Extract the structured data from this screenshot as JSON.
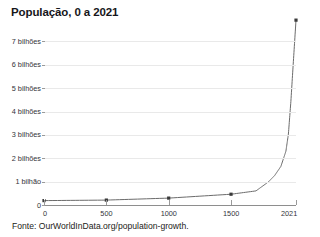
{
  "chart_data": {
    "type": "line",
    "title": "População, 0 a 2021",
    "xlabel": "",
    "ylabel": "",
    "xlim": [
      0,
      2021
    ],
    "ylim": [
      0,
      8000000000
    ],
    "grid": true,
    "legend": false,
    "legend_position": "none",
    "source_note": "Fonte: OurWorldInData.org/population-growth.",
    "line_color": "#6b6b6b",
    "marker_color": "#3a3a3a",
    "grid_color": "#e9e9e9",
    "axis_color": "#8e8e8e",
    "x_tick_values": [
      0,
      500,
      1000,
      1500,
      2021
    ],
    "x_tick_labels": [
      "0",
      "500",
      "1000",
      "1500",
      "2021"
    ],
    "y_tick_values": [
      0,
      1000000000,
      2000000000,
      3000000000,
      4000000000,
      5000000000,
      6000000000,
      7000000000
    ],
    "y_tick_labels": [
      "0",
      "1 bilhão",
      "2 bilhões",
      "3 bilhões",
      "4 bilhões",
      "5 bilhões",
      "6 bilhões",
      "7 bilhões"
    ],
    "x": [
      0,
      500,
      1000,
      1500,
      1700,
      1800,
      1850,
      1900,
      1940,
      1960,
      1980,
      2000,
      2021
    ],
    "values": [
      188000000,
      210000000,
      295000000,
      461000000,
      603000000,
      990000000,
      1263000000,
      1654000000,
      2300000000,
      3034000000,
      4434000000,
      6144000000,
      7909000000
    ],
    "series": [
      {
        "name": "População mundial",
        "x": [
          0,
          500,
          1000,
          1500,
          1700,
          1800,
          1850,
          1900,
          1940,
          1960,
          1980,
          2000,
          2021
        ],
        "values": [
          188000000,
          210000000,
          295000000,
          461000000,
          603000000,
          990000000,
          1263000000,
          1654000000,
          2300000000,
          3034000000,
          4434000000,
          6144000000,
          7909000000
        ]
      }
    ],
    "marker_points_x": [
      0,
      500,
      1000,
      1500,
      2021
    ]
  }
}
